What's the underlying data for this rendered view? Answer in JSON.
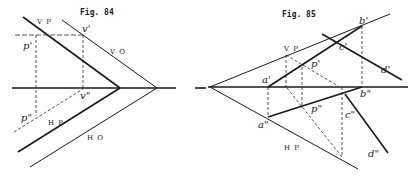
{
  "figures": [
    {
      "title": "Fig. 84",
      "labels": {
        "vp": "V P",
        "vo": "V O",
        "hp": "H P",
        "ho": "H O",
        "p_prime": "p'",
        "p_double": "p\"",
        "v_prime": "v'",
        "v_double": "v\""
      }
    },
    {
      "title": "Fig. 85",
      "labels": {
        "vp": "V P",
        "hp": "H P",
        "a_prime": "a'",
        "a_double": "a\"",
        "b_prime": "b'",
        "b_double": "b\"",
        "c_prime": "c'",
        "c_double": "c\"",
        "d_prime": "d'",
        "d_double": "d\"",
        "p_prime": "p'",
        "p_double": "p\""
      }
    }
  ]
}
